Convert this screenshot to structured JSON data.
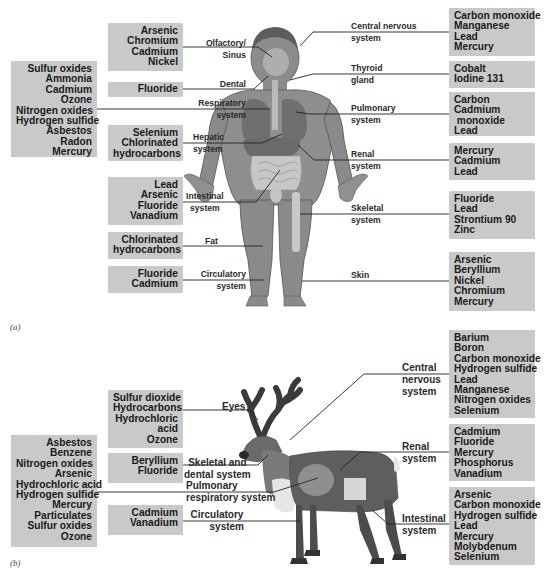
{
  "panel_a": {
    "label": "(a)",
    "left_boxes": [
      {
        "id": "olfactory",
        "items": [
          "Arsenic",
          "Chromium",
          "Cadmium",
          "Nickel"
        ],
        "organ": [
          "Olfactory/",
          "Sinus"
        ]
      },
      {
        "id": "dental",
        "items": [
          "Fluoride"
        ],
        "organ": [
          "Dental"
        ]
      },
      {
        "id": "respiratory",
        "items": [
          "Sulfur oxides",
          "Ammonia",
          "Cadmium",
          "Ozone",
          "Nitrogen oxides",
          "Hydrogen sulfide",
          "Asbestos",
          "Radon",
          "Mercury"
        ],
        "organ": [
          "Respiratory",
          "system"
        ]
      },
      {
        "id": "hepatic",
        "items": [
          "Selenium",
          "Chlorinated",
          "hydrocarbons"
        ],
        "organ": [
          "Hepatic",
          "system"
        ]
      },
      {
        "id": "intestinal",
        "items": [
          "Lead",
          "Arsenic",
          "Fluoride",
          "Vanadium"
        ],
        "organ": [
          "Intestinal",
          "system"
        ]
      },
      {
        "id": "fat",
        "items": [
          "Chlorinated",
          "hydrocarbons"
        ],
        "organ": [
          "Fat"
        ]
      },
      {
        "id": "circulatory",
        "items": [
          "Fluoride",
          "Cadmium"
        ],
        "organ": [
          "Circulatory",
          "system"
        ]
      }
    ],
    "right_boxes": [
      {
        "id": "cns",
        "items": [
          "Carbon monoxide",
          "Manganese",
          "Lead",
          "Mercury"
        ],
        "organ": [
          "Central nervous",
          "system"
        ]
      },
      {
        "id": "thyroid",
        "items": [
          "Cobalt",
          "Iodine 131"
        ],
        "organ": [
          "Thyroid",
          "gland"
        ]
      },
      {
        "id": "pulmonary",
        "items": [
          "Carbon",
          "Cadmium",
          " monoxide",
          "Lead"
        ],
        "organ": [
          "Pulmonary",
          "system"
        ]
      },
      {
        "id": "renal",
        "items": [
          "Mercury",
          "Cadmium",
          "Lead"
        ],
        "organ": [
          "Renal",
          "system"
        ]
      },
      {
        "id": "skeletal",
        "items": [
          "Fluoride",
          "Lead",
          "Strontium 90",
          "Zinc"
        ],
        "organ": [
          "Skeletal",
          "system"
        ]
      },
      {
        "id": "skin",
        "items": [
          "Arsenic",
          "Beryllium",
          "Nickel",
          "Chromium",
          "Mercury"
        ],
        "organ": [
          "Skin"
        ]
      }
    ]
  },
  "panel_b": {
    "label": "(b)",
    "left_boxes": [
      {
        "id": "eyes",
        "items": [
          "Sulfur dioxide",
          "Hydrocarbons",
          "Hydrochloric",
          "acid",
          "Ozone"
        ],
        "organ": [
          "Eyes"
        ]
      },
      {
        "id": "skeletal_dental",
        "items": [
          "Beryllium",
          "Fluoride"
        ],
        "organ": [
          "Skeletal and",
          "dental system"
        ]
      },
      {
        "id": "pulmonary",
        "items": [
          "Asbestos",
          "Benzene",
          "Nitrogen oxides",
          "Arsenic",
          "Hydrochloric acid",
          "Hydrogen sulfide",
          "Mercury",
          "Particulates",
          "Sulfur oxides",
          "Ozone"
        ],
        "organ": [
          "Pulmonary",
          "respiratory system"
        ]
      },
      {
        "id": "circulatory",
        "items": [
          "Cadmium",
          "Vanadium"
        ],
        "organ": [
          "Circulatory",
          "system"
        ]
      }
    ],
    "right_boxes": [
      {
        "id": "cns",
        "items": [
          "Barium",
          "Boron",
          "Carbon monoxide",
          "Hydrogen sulfide",
          "Lead",
          "Manganese",
          "Nitrogen oxides",
          "Selenium"
        ],
        "organ": [
          "Central",
          "nervous",
          "system"
        ]
      },
      {
        "id": "renal",
        "items": [
          "Cadmium",
          "Fluoride",
          "Mercury",
          "Phosphorus",
          "Vanadium"
        ],
        "organ": [
          "Renal",
          "system"
        ]
      },
      {
        "id": "intestinal",
        "items": [
          "Arsenic",
          "Carbon monoxide",
          "Hydrogen sulfide",
          "Lead",
          "Mercury",
          "Molybdenum",
          "Selenium"
        ],
        "organ": [
          "Intestinal",
          "system"
        ]
      }
    ]
  },
  "colors": {
    "box": "#c9c9c9",
    "line": "#222222",
    "skin": "#8a8a8a",
    "organ": "#6e6e6e"
  }
}
